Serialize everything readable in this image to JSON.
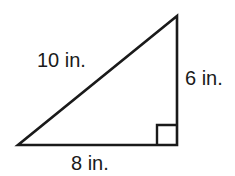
{
  "figure": {
    "name": "right-triangle",
    "background_color": "#ffffff",
    "stroke_color": "#1a1a1a",
    "text_color": "#1a1a1a",
    "stroke_width": 2.6,
    "canvas": {
      "width": 235,
      "height": 176
    },
    "vertices": {
      "bottom_left": {
        "x": 18,
        "y": 145
      },
      "bottom_right": {
        "x": 177,
        "y": 145
      },
      "apex": {
        "x": 177,
        "y": 16
      }
    },
    "right_angle_marker": {
      "name": "right-angle-square",
      "x": 157,
      "y": 125,
      "size": 19
    },
    "labels": {
      "hypotenuse": "10 in.",
      "vertical_leg": "6 in.",
      "horizontal_leg": "8 in."
    }
  },
  "chart_data": {
    "type": "diagram",
    "shape": "right triangle",
    "title": "",
    "sides": [
      {
        "name": "hypotenuse",
        "label": "10 in.",
        "length": 10,
        "unit": "in."
      },
      {
        "name": "vertical leg",
        "label": "6 in.",
        "length": 6,
        "unit": "in."
      },
      {
        "name": "horizontal leg",
        "label": "8 in.",
        "length": 8,
        "unit": "in."
      }
    ],
    "angles": [
      {
        "name": "right angle",
        "vertex": "bottom_right",
        "degrees": 90,
        "marked": true
      }
    ]
  }
}
